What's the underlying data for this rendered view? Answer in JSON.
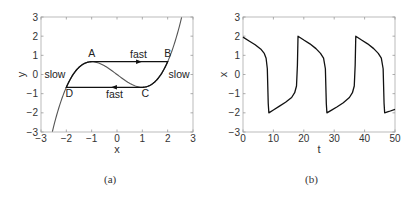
{
  "figure": {
    "panels": [
      {
        "caption": "(a)"
      },
      {
        "caption": "(b)"
      }
    ]
  },
  "chart_data": [
    {
      "type": "line",
      "panel": "(a)",
      "title": "",
      "xlabel": "x",
      "ylabel": "y",
      "xlim": [
        -3,
        3
      ],
      "ylim": [
        -3,
        3
      ],
      "xticks": [
        -3,
        -2,
        -1,
        0,
        1,
        2,
        3
      ],
      "yticks": [
        -3,
        -2,
        -1,
        0,
        1,
        2,
        3
      ],
      "grid": false,
      "series": [
        {
          "name": "cubic nullcline y = x^3/3 - x",
          "color": "#555555",
          "x": [
            -2.55,
            -2.4,
            -2.2,
            -2.0,
            -1.8,
            -1.6,
            -1.4,
            -1.2,
            -1.0,
            -0.8,
            -0.6,
            -0.4,
            -0.2,
            0.0,
            0.2,
            0.4,
            0.6,
            0.8,
            1.0,
            1.2,
            1.4,
            1.6,
            1.8,
            2.0,
            2.2,
            2.4,
            2.55
          ],
          "y": [
            -2.98,
            -2.21,
            -1.35,
            -0.667,
            -0.144,
            0.235,
            0.485,
            0.624,
            0.667,
            0.629,
            0.528,
            0.379,
            0.197,
            0.0,
            -0.197,
            -0.379,
            -0.528,
            -0.629,
            -0.667,
            -0.624,
            -0.485,
            -0.235,
            0.144,
            0.667,
            1.35,
            2.21,
            2.98
          ]
        },
        {
          "name": "limit cycle",
          "color": "#111111",
          "path": [
            [
              -1.0,
              0.667
            ],
            [
              2.0,
              0.667
            ],
            [
              1.0,
              -0.667
            ],
            [
              -2.0,
              -0.667
            ],
            [
              -1.0,
              0.667
            ]
          ]
        }
      ],
      "points": [
        {
          "label": "A",
          "x": -1.0,
          "y": 0.667
        },
        {
          "label": "B",
          "x": 2.0,
          "y": 0.667
        },
        {
          "label": "C",
          "x": 1.0,
          "y": -0.667
        },
        {
          "label": "D",
          "x": -2.0,
          "y": -0.667
        }
      ],
      "annotations": [
        {
          "text": "fast",
          "x": 0.85,
          "y": 1.05
        },
        {
          "text": "fast",
          "x": -0.1,
          "y": -1.05
        },
        {
          "text": "slow",
          "x": -2.45,
          "y": 0.0
        },
        {
          "text": "slow",
          "x": 2.45,
          "y": 0.0
        }
      ],
      "arrows": [
        {
          "x": 0.85,
          "y": 0.667,
          "direction": "right"
        },
        {
          "x": -0.1,
          "y": -0.667,
          "direction": "left"
        }
      ]
    },
    {
      "type": "line",
      "panel": "(b)",
      "title": "",
      "xlabel": "t",
      "ylabel": "x",
      "xlim": [
        0,
        50
      ],
      "ylim": [
        -3,
        3
      ],
      "xticks": [
        0,
        10,
        20,
        30,
        40,
        50
      ],
      "yticks": [
        -3,
        -2,
        -1,
        0,
        1,
        2,
        3
      ],
      "grid": false,
      "series": [
        {
          "name": "x(t)",
          "color": "#111111",
          "t": [
            0,
            2,
            4,
            6,
            7,
            7.6,
            8.0,
            8.3,
            8.5,
            10,
            12,
            14,
            16,
            17,
            17.6,
            17.9,
            18.1,
            20,
            22,
            24,
            25.5,
            26.5,
            27.1,
            27.4,
            27.6,
            29,
            31,
            33,
            35,
            36,
            36.6,
            36.9,
            37.1,
            39,
            41,
            43,
            44.5,
            45.5,
            46.1,
            46.4,
            46.6,
            48,
            50
          ],
          "x": [
            1.95,
            1.75,
            1.55,
            1.3,
            1.1,
            0.85,
            0.3,
            -1.5,
            -2.0,
            -1.85,
            -1.65,
            -1.45,
            -1.2,
            -0.95,
            -0.6,
            0.5,
            2.0,
            1.8,
            1.6,
            1.35,
            1.1,
            0.85,
            0.3,
            -1.5,
            -2.0,
            -1.87,
            -1.68,
            -1.47,
            -1.2,
            -0.95,
            -0.6,
            0.5,
            2.0,
            1.8,
            1.6,
            1.35,
            1.1,
            0.85,
            0.3,
            -1.5,
            -2.0,
            -1.93,
            -1.82
          ]
        }
      ]
    }
  ]
}
